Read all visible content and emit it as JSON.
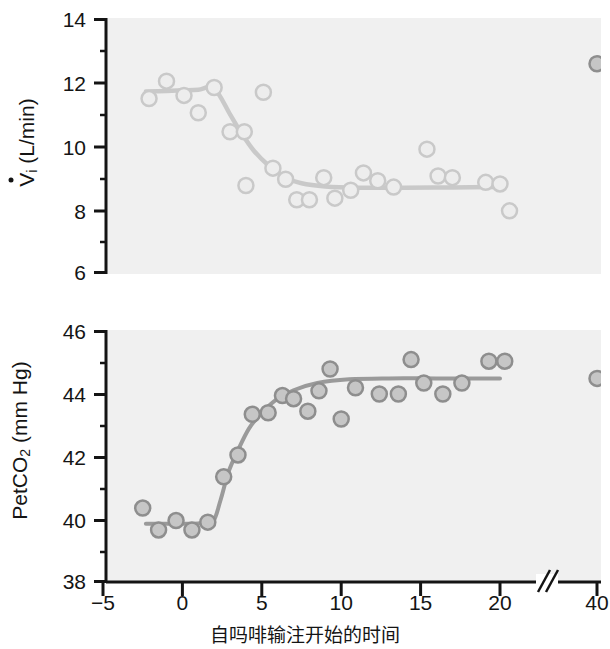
{
  "figure": {
    "caption": "自吗啡输注开始的时间",
    "plot_bg": "#f0f0f0",
    "axis_color": "#141414",
    "marker_fill_top": "#ededed",
    "marker_stroke_top": "#c9c9c9",
    "marker_fill_bottom": "#c6c6c6",
    "marker_stroke_bottom": "#8e8e8e",
    "fit_color_top": "#c9c9c9",
    "fit_color_bottom": "#9a9a9a"
  },
  "chart_data": [
    {
      "type": "scatter",
      "panel": "top",
      "title": "",
      "xlabel": "自吗啡输注开始的时间",
      "ylabel": "V̇i (L/min)",
      "ylabel_parts": {
        "symbol": "V",
        "subscript": "i",
        "units": "(L/min)"
      },
      "xlim": [
        -5,
        22.5
      ],
      "ylim": [
        6,
        14
      ],
      "yticks": [
        6,
        8,
        10,
        12,
        14
      ],
      "ytick_labels": [
        "6",
        "8",
        "10",
        "12",
        "14"
      ],
      "yminor_ticks": [
        7,
        9,
        11,
        13
      ],
      "xticks": [
        -5,
        0,
        5,
        10,
        15,
        20,
        40
      ],
      "xtick_labels": [
        "−5",
        "0",
        "5",
        "10",
        "15",
        "20",
        "40"
      ],
      "axis_break": true,
      "axis_break_at_x": 22.2,
      "grid": false,
      "points": [
        {
          "x": -2.1,
          "y": 11.5
        },
        {
          "x": -1.0,
          "y": 12.05
        },
        {
          "x": 0.1,
          "y": 11.6
        },
        {
          "x": 1.0,
          "y": 11.05
        },
        {
          "x": 2.0,
          "y": 11.85
        },
        {
          "x": 3.0,
          "y": 10.45
        },
        {
          "x": 3.9,
          "y": 10.45
        },
        {
          "x": 4.0,
          "y": 8.75
        },
        {
          "x": 5.1,
          "y": 11.7
        },
        {
          "x": 5.7,
          "y": 9.3
        },
        {
          "x": 6.5,
          "y": 8.95
        },
        {
          "x": 7.2,
          "y": 8.3
        },
        {
          "x": 8.0,
          "y": 8.3
        },
        {
          "x": 8.9,
          "y": 9.0
        },
        {
          "x": 9.6,
          "y": 8.35
        },
        {
          "x": 10.6,
          "y": 8.6
        },
        {
          "x": 11.4,
          "y": 9.15
        },
        {
          "x": 12.3,
          "y": 8.9
        },
        {
          "x": 13.3,
          "y": 8.7
        },
        {
          "x": 15.4,
          "y": 9.9
        },
        {
          "x": 16.1,
          "y": 9.05
        },
        {
          "x": 17.0,
          "y": 9.0
        },
        {
          "x": 19.1,
          "y": 8.85
        },
        {
          "x": 20.0,
          "y": 8.8
        },
        {
          "x": 20.6,
          "y": 7.95
        },
        {
          "x": 40.0,
          "y": 12.6
        }
      ],
      "fit_curve": [
        {
          "x": -2.3,
          "y": 11.72
        },
        {
          "x": -1.0,
          "y": 11.74
        },
        {
          "x": 0.0,
          "y": 11.76
        },
        {
          "x": 1.0,
          "y": 11.78
        },
        {
          "x": 2.0,
          "y": 11.82
        },
        {
          "x": 3.0,
          "y": 11.0
        },
        {
          "x": 3.6,
          "y": 10.5
        },
        {
          "x": 4.5,
          "y": 9.85
        },
        {
          "x": 5.5,
          "y": 9.35
        },
        {
          "x": 6.5,
          "y": 9.0
        },
        {
          "x": 7.5,
          "y": 8.82
        },
        {
          "x": 9.0,
          "y": 8.72
        },
        {
          "x": 11.0,
          "y": 8.68
        },
        {
          "x": 14.0,
          "y": 8.68
        },
        {
          "x": 17.0,
          "y": 8.69
        },
        {
          "x": 20.0,
          "y": 8.7
        }
      ]
    },
    {
      "type": "scatter",
      "panel": "bottom",
      "title": "",
      "xlabel": "自吗啡输注开始的时间",
      "ylabel": "PetCO2 (mm Hg)",
      "ylabel_parts": {
        "symbol": "PetCO",
        "subscript": "2",
        "units": "(mm Hg)"
      },
      "xlim": [
        -5,
        22.5
      ],
      "ylim": [
        38,
        46
      ],
      "yticks": [
        38,
        40,
        42,
        44,
        46
      ],
      "ytick_labels": [
        "38",
        "40",
        "42",
        "44",
        "46"
      ],
      "yminor_ticks": [
        39,
        41,
        43,
        45
      ],
      "xticks": [
        -5,
        0,
        5,
        10,
        15,
        20,
        40
      ],
      "xtick_labels": [
        "−5",
        "0",
        "5",
        "10",
        "15",
        "20",
        "40"
      ],
      "axis_break": true,
      "axis_break_at_x": 22.2,
      "grid": false,
      "points": [
        {
          "x": -2.5,
          "y": 40.35
        },
        {
          "x": -1.5,
          "y": 39.65
        },
        {
          "x": -0.4,
          "y": 39.95
        },
        {
          "x": 0.6,
          "y": 39.65
        },
        {
          "x": 1.6,
          "y": 39.9
        },
        {
          "x": 2.6,
          "y": 41.35
        },
        {
          "x": 3.5,
          "y": 42.05
        },
        {
          "x": 4.4,
          "y": 43.35
        },
        {
          "x": 5.4,
          "y": 43.4
        },
        {
          "x": 6.3,
          "y": 43.95
        },
        {
          "x": 7.0,
          "y": 43.85
        },
        {
          "x": 7.9,
          "y": 43.45
        },
        {
          "x": 8.6,
          "y": 44.1
        },
        {
          "x": 9.3,
          "y": 44.8
        },
        {
          "x": 10.0,
          "y": 43.2
        },
        {
          "x": 10.9,
          "y": 44.2
        },
        {
          "x": 12.4,
          "y": 44.0
        },
        {
          "x": 13.6,
          "y": 44.0
        },
        {
          "x": 14.4,
          "y": 45.1
        },
        {
          "x": 15.2,
          "y": 44.35
        },
        {
          "x": 16.4,
          "y": 44.0
        },
        {
          "x": 17.6,
          "y": 44.35
        },
        {
          "x": 19.3,
          "y": 45.05
        },
        {
          "x": 20.3,
          "y": 45.05
        },
        {
          "x": 40.0,
          "y": 44.5
        }
      ],
      "fit_curve": [
        {
          "x": -2.3,
          "y": 39.85
        },
        {
          "x": -1.0,
          "y": 39.85
        },
        {
          "x": 0.0,
          "y": 39.85
        },
        {
          "x": 1.0,
          "y": 39.86
        },
        {
          "x": 1.9,
          "y": 39.9
        },
        {
          "x": 2.4,
          "y": 40.6
        },
        {
          "x": 2.9,
          "y": 41.5
        },
        {
          "x": 3.5,
          "y": 42.2
        },
        {
          "x": 4.2,
          "y": 42.9
        },
        {
          "x": 5.0,
          "y": 43.4
        },
        {
          "x": 6.0,
          "y": 43.85
        },
        {
          "x": 7.0,
          "y": 44.12
        },
        {
          "x": 8.5,
          "y": 44.35
        },
        {
          "x": 10.5,
          "y": 44.47
        },
        {
          "x": 13.0,
          "y": 44.5
        },
        {
          "x": 16.0,
          "y": 44.5
        },
        {
          "x": 20.0,
          "y": 44.5
        }
      ]
    }
  ]
}
